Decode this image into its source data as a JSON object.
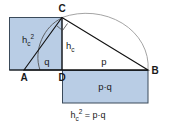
{
  "figure": {
    "type": "geometry-diagram",
    "title_caption": "h",
    "caption": {
      "base": "h",
      "sub": "c",
      "sup": "2",
      "relation": " = p·q"
    },
    "colors": {
      "fill": "#b9cde5",
      "stroke": "#3a4a5a",
      "line": "#1a1a1a",
      "arc": "#8a8a8a",
      "background": "#ffffff"
    },
    "vertices": [
      {
        "name": "A",
        "label": "A",
        "x": 24,
        "y": 70
      },
      {
        "name": "B",
        "label": "B",
        "x": 148,
        "y": 70
      },
      {
        "name": "C",
        "label": "C",
        "x": 62,
        "y": 17
      },
      {
        "name": "D",
        "label": "D",
        "x": 62,
        "y": 70
      }
    ],
    "segment_labels": [
      {
        "name": "q",
        "label": "q",
        "x": 44,
        "y": 64
      },
      {
        "name": "p",
        "label": "p",
        "x": 102,
        "y": 64
      }
    ],
    "altitude_label": {
      "base": "h",
      "sub": "c",
      "x": 68,
      "y": 48
    },
    "square_label": {
      "base": "h",
      "sub": "c",
      "sup": "2",
      "x": 27,
      "y": 42
    },
    "rect_label": {
      "text": "p·q",
      "x": 105,
      "y": 89
    },
    "square": {
      "x": 9,
      "y": 17,
      "width": 53,
      "height": 53
    },
    "rectangle": {
      "x": 62,
      "y": 70,
      "width": 86,
      "height": 33
    },
    "right_angle_marker_at": "C",
    "semicircle_over": "AB",
    "arc_from_C_to": "D"
  }
}
